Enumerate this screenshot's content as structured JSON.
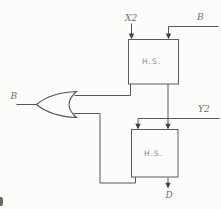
{
  "figure": {
    "colors": {
      "background": "#fcfcfb",
      "wire": "#565656",
      "label": "#6f6f6f"
    },
    "blocks": [
      {
        "id": "hs-top",
        "label": "H.S."
      },
      {
        "id": "hs-bottom",
        "label": "H.S."
      }
    ],
    "labels": {
      "x2": "X2",
      "b_in": "B",
      "y2": "Y2",
      "b_out": "B",
      "d_out": "D"
    },
    "gate": {
      "type": "or-gate",
      "orientation": "pointing-left"
    }
  }
}
